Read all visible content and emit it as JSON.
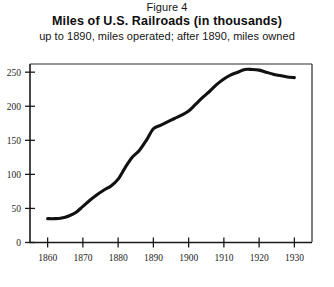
{
  "figure": {
    "number_label": "Figure 4",
    "title": "Miles of U.S. Railroads (in thousands)",
    "subtitle": "up to 1890, miles operated; after 1890, miles owned"
  },
  "colors": {
    "line": "#111111",
    "axis": "#1a1a1a",
    "frame": "#2b2b2b",
    "background": "#ffffff",
    "text": "#141414"
  },
  "axes": {
    "y_ticks": [
      "0",
      "50",
      "100",
      "150",
      "200",
      "250"
    ],
    "x_ticks": [
      "1860",
      "1870",
      "1880",
      "1890",
      "1900",
      "1910",
      "1920",
      "1930"
    ]
  },
  "chart_data": {
    "type": "line",
    "title": "Miles of U.S. Railroads (in thousands)",
    "subtitle": "up to 1890, miles operated; after 1890, miles owned",
    "xlabel": "",
    "ylabel": "",
    "xlim": [
      1855,
      1935
    ],
    "ylim": [
      0,
      262
    ],
    "grid": false,
    "legend": "none",
    "x_tick_values": [
      1860,
      1870,
      1880,
      1890,
      1900,
      1910,
      1920,
      1930
    ],
    "y_tick_values": [
      0,
      50,
      100,
      150,
      200,
      250
    ],
    "series": [
      {
        "name": "Miles of U.S. railroads (thousands)",
        "x": [
          1860,
          1862,
          1864,
          1866,
          1868,
          1870,
          1872,
          1874,
          1876,
          1878,
          1880,
          1882,
          1884,
          1886,
          1888,
          1890,
          1892,
          1894,
          1896,
          1898,
          1900,
          1902,
          1904,
          1906,
          1908,
          1910,
          1912,
          1914,
          1916,
          1918,
          1920,
          1922,
          1924,
          1926,
          1928,
          1930
        ],
        "y": [
          35,
          35,
          36,
          39,
          44,
          53,
          62,
          70,
          77,
          83,
          93,
          110,
          125,
          135,
          150,
          167,
          172,
          177,
          182,
          187,
          193,
          203,
          213,
          222,
          232,
          240,
          246,
          250,
          254,
          254,
          253,
          250,
          247,
          245,
          243,
          242
        ]
      }
    ]
  }
}
